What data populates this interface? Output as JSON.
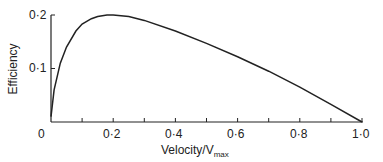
{
  "chart_data": {
    "type": "line",
    "title": "",
    "xlabel": "Velocity/V_max",
    "xlabel_main": "Velocity/V",
    "xlabel_sub": "max",
    "ylabel": "Efficiency",
    "xlim": [
      0,
      1.0
    ],
    "ylim": [
      0,
      0.2
    ],
    "x_ticks": [
      "0",
      "0·2",
      "0·4",
      "0·6",
      "0·8",
      "1·0"
    ],
    "y_ticks": [
      "0·1",
      "0·2"
    ],
    "grid": false,
    "series": [
      {
        "name": "Efficiency",
        "x": [
          0,
          0.01,
          0.03,
          0.05,
          0.08,
          0.1,
          0.13,
          0.15,
          0.18,
          0.2,
          0.25,
          0.3,
          0.4,
          0.5,
          0.6,
          0.7,
          0.8,
          0.9,
          1.0
        ],
        "y": [
          0.01,
          0.06,
          0.11,
          0.14,
          0.17,
          0.183,
          0.193,
          0.197,
          0.2,
          0.2,
          0.197,
          0.19,
          0.17,
          0.147,
          0.122,
          0.095,
          0.065,
          0.033,
          0.0
        ]
      }
    ]
  }
}
